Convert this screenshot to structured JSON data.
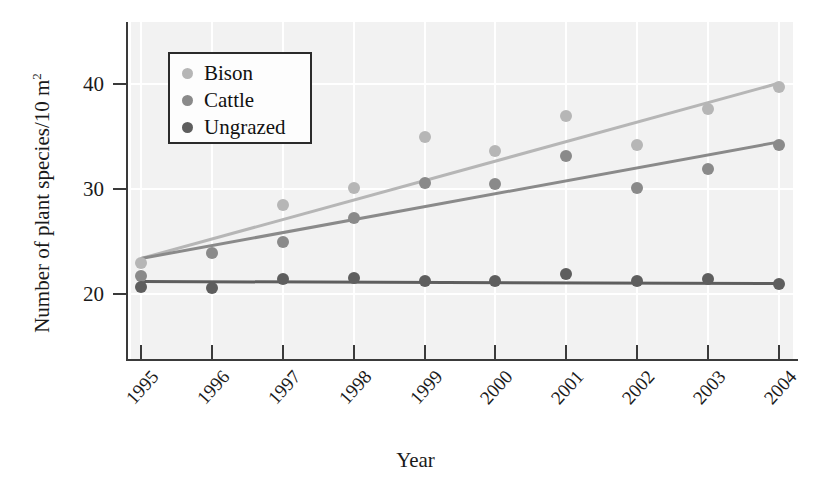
{
  "figure": {
    "background": "#ffffff",
    "panel_background": "#f2f2f2"
  },
  "axes": {
    "x_title": "Year",
    "y_title_main": "Number of plant species/10 m",
    "y_title_sup": "2",
    "y_ticks": [
      "20",
      "30",
      "40"
    ],
    "x_ticks": [
      "1995",
      "1996",
      "1997",
      "1998",
      "1999",
      "2000",
      "2001",
      "2002",
      "2003",
      "2004"
    ]
  },
  "legend": {
    "entries": [
      {
        "label": "Bison",
        "color": "#b6b6b6"
      },
      {
        "label": "Cattle",
        "color": "#8a8a8a"
      },
      {
        "label": "Ungrazed",
        "color": "#5e5e5e"
      }
    ]
  },
  "chart_data": {
    "type": "scatter",
    "title": "",
    "xlabel": "Year",
    "ylabel": "Number of plant species/10 m2",
    "x": [
      1995,
      1996,
      1997,
      1998,
      1999,
      2000,
      2001,
      2002,
      2003,
      2004
    ],
    "xlim": [
      1994.5,
      2004.6
    ],
    "ylim": [
      16.5,
      43.5
    ],
    "grid": true,
    "legend_position": "upper-left-inside",
    "series": [
      {
        "name": "Bison",
        "color": "#b6b6b6",
        "values": [
          23.0,
          null,
          28.5,
          30.1,
          35.0,
          33.6,
          37.0,
          34.2,
          37.6,
          39.7
        ],
        "trendline": {
          "x_start": 1995,
          "y_start": 23.4,
          "x_end": 2004,
          "y_end": 40.1
        }
      },
      {
        "name": "Cattle",
        "color": "#8a8a8a",
        "values": [
          21.7,
          23.9,
          25.0,
          27.2,
          30.6,
          30.5,
          33.1,
          30.1,
          31.9,
          34.2
        ],
        "trendline": {
          "x_start": 1995,
          "y_start": 23.4,
          "x_end": 2004,
          "y_end": 34.5
        }
      },
      {
        "name": "Ungrazed",
        "color": "#5e5e5e",
        "values": [
          20.7,
          20.6,
          21.4,
          21.5,
          21.2,
          21.2,
          21.9,
          21.2,
          21.4,
          21.0
        ],
        "trendline": {
          "x_start": 1995,
          "y_start": 21.2,
          "x_end": 2004,
          "y_end": 21.0
        }
      }
    ]
  }
}
